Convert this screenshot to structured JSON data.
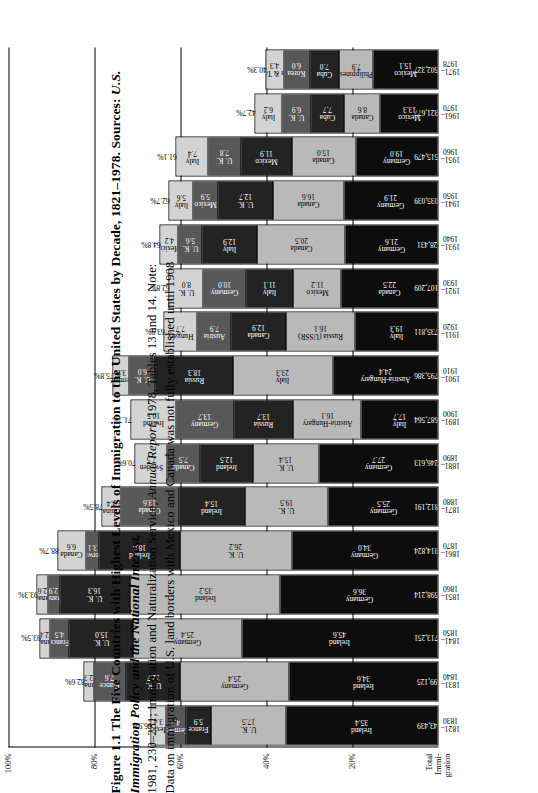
{
  "figure": {
    "number": "Figure 1.1",
    "title": "The Five Countries with Highest Levels of Immigration to the United States by Decade, 1821–1978. Sources:",
    "source_italic_1": "U.S. Immigration Policy and the National Interest,",
    "source_rest_1": " 1981, 230–231; Immigration and Naturalization Service,",
    "source_italic_2": "Annual Report,",
    "source_rest_2": " 1978, Tables 13 and 14. Note:",
    "note": "Data on immigration of U.S. land borders with Mexico and Canada was not fully established until 1908"
  },
  "chart_data": {
    "type": "bar",
    "subtype": "stacked-column",
    "title": "The Five Countries with Highest Levels of Immigration to the United States by Decade, 1821–1978",
    "xlabel": "",
    "ylabel": "",
    "ylim": [
      0,
      100
    ],
    "ytick_labels": [
      "100%",
      "80%",
      "60%",
      "40%",
      "20%",
      "Total Immi- gration"
    ],
    "ytick_values": [
      100,
      80,
      60,
      40,
      20,
      0
    ],
    "grid": true,
    "legend": "none",
    "note": "Each column stacks the five largest source countries; the label above each column is the combined share of the top five.",
    "categories": [
      "1821–1830",
      "1831–1840",
      "1841–1850",
      "1851–1860",
      "1861–1870",
      "1871–1880",
      "1881–1890",
      "1891–1900",
      "1901–1910",
      "1911–1920",
      "1921–1930",
      "1931–1940",
      "1941–1950",
      "1951–1960",
      "1961–1970",
      "1971–1978"
    ],
    "columns": [
      {
        "period": "1821–1830",
        "top5_pct": "66.9%",
        "total": "143,439",
        "segments": [
          {
            "country": "Ireland",
            "value": 35.4,
            "color": "c1"
          },
          {
            "country": "U. K.",
            "value": 17.5,
            "color": "c2"
          },
          {
            "country": "France",
            "value": 5.9,
            "color": "c3"
          },
          {
            "country": "Germany",
            "value": 4.7,
            "color": "c4"
          },
          {
            "country": "Mexico",
            "value": 3.4,
            "color": "c5"
          }
        ]
      },
      {
        "period": "1831–1840",
        "top5_pct": "82.6%",
        "total": "599,125",
        "segments": [
          {
            "country": "Ireland",
            "value": 34.6,
            "color": "c1"
          },
          {
            "country": "Germany",
            "value": 25.4,
            "color": "c2"
          },
          {
            "country": "U. K.",
            "value": 12.7,
            "color": "c3"
          },
          {
            "country": "France",
            "value": 7.6,
            "color": "c4"
          },
          {
            "country": "Canada",
            "value": 2.3,
            "color": "c5"
          }
        ]
      },
      {
        "period": "1841–1850",
        "top5_pct": "93.5%",
        "total": "1,713,251",
        "segments": [
          {
            "country": "Ireland",
            "value": 45.6,
            "color": "c1"
          },
          {
            "country": "Germany",
            "value": 25.4,
            "color": "c2"
          },
          {
            "country": "U. K.",
            "value": 15.0,
            "color": "c3"
          },
          {
            "country": "France",
            "value": 4.5,
            "color": "c4"
          },
          {
            "country": "Canada",
            "value": 2.4,
            "color": "c5"
          }
        ]
      },
      {
        "period": "1851–1860",
        "top5_pct": "93.3%",
        "total": "2,598,214",
        "segments": [
          {
            "country": "Germany",
            "value": 36.6,
            "color": "c1"
          },
          {
            "country": "Ireland",
            "value": 35.2,
            "color": "c2"
          },
          {
            "country": "U. K.",
            "value": 16.3,
            "color": "c3"
          },
          {
            "country": "France",
            "value": 2.9,
            "color": "c4"
          },
          {
            "country": "Canada",
            "value": 2.6,
            "color": "c5"
          }
        ]
      },
      {
        "period": "1861–1870",
        "top5_pct": "88.7%",
        "total": "2,314,824",
        "segments": [
          {
            "country": "Germany",
            "value": 34.0,
            "color": "c1"
          },
          {
            "country": "U. K.",
            "value": 26.2,
            "color": "c2"
          },
          {
            "country": "Ireland",
            "value": 18.8,
            "color": "c3"
          },
          {
            "country": "Norway",
            "value": 3.1,
            "color": "c4"
          },
          {
            "country": "Canada",
            "value": 6.6,
            "color": "c5"
          }
        ]
      },
      {
        "period": "1871–1880",
        "top5_pct": "78.5%",
        "total": "2,812,191",
        "segments": [
          {
            "country": "Germany",
            "value": 25.5,
            "color": "c1"
          },
          {
            "country": "U. K.",
            "value": 19.5,
            "color": "c2"
          },
          {
            "country": "Ireland",
            "value": 15.4,
            "color": "c3"
          },
          {
            "country": "Canada",
            "value": 13.6,
            "color": "c4"
          },
          {
            "country": "China",
            "value": 4.4,
            "color": "c5"
          }
        ]
      },
      {
        "period": "1881–1890",
        "top5_pct": "70.6%",
        "total": "5,246,613",
        "segments": [
          {
            "country": "Germany",
            "value": 27.7,
            "color": "c1"
          },
          {
            "country": "U. K.",
            "value": 15.4,
            "color": "c2"
          },
          {
            "country": "Ireland",
            "value": 12.5,
            "color": "c3"
          },
          {
            "country": "Canada",
            "value": 7.5,
            "color": "c4"
          },
          {
            "country": "Sweden",
            "value": 7.5,
            "color": "c5"
          }
        ]
      },
      {
        "period": "1891–1900",
        "top5_pct": "71.7%",
        "total": "3,687,564",
        "segments": [
          {
            "country": "Italy",
            "value": 17.7,
            "color": "c1"
          },
          {
            "country": "Austria-Hungary",
            "value": 16.1,
            "color": "c2"
          },
          {
            "country": "Russia",
            "value": 13.7,
            "color": "c3"
          },
          {
            "country": "Germany",
            "value": 13.7,
            "color": "c4"
          },
          {
            "country": "Ireland",
            "value": 10.5,
            "color": "c5"
          }
        ]
      },
      {
        "period": "1901–1910",
        "top5_pct": "75.8%",
        "total": "8,795,386",
        "segments": [
          {
            "country": "Austria-Hungary",
            "value": 24.4,
            "color": "c1"
          },
          {
            "country": "Italy",
            "value": 23.3,
            "color": "c2"
          },
          {
            "country": "Russia",
            "value": 18.3,
            "color": "c3"
          },
          {
            "country": "U. K.",
            "value": 6.0,
            "color": "c4"
          },
          {
            "country": "Germany",
            "value": 3.9,
            "color": "c5"
          }
        ]
      },
      {
        "period": "1911–1920",
        "top5_pct": "63.9%",
        "total": "5,735,811",
        "segments": [
          {
            "country": "Italy",
            "value": 19.3,
            "color": "c1"
          },
          {
            "country": "Russia (USSR)",
            "value": 16.1,
            "color": "c2"
          },
          {
            "country": "Canada",
            "value": 12.9,
            "color": "c3"
          },
          {
            "country": "Austria",
            "value": 7.9,
            "color": "c4"
          },
          {
            "country": "Hungary",
            "value": 7.7,
            "color": "c5"
          }
        ]
      },
      {
        "period": "1921–1930",
        "top5_pct": "62.8%",
        "total": "4,107,209",
        "segments": [
          {
            "country": "Canada",
            "value": 22.5,
            "color": "c1"
          },
          {
            "country": "Mexico",
            "value": 11.2,
            "color": "c2"
          },
          {
            "country": "Italy",
            "value": 11.1,
            "color": "c3"
          },
          {
            "country": "Germany",
            "value": 10.0,
            "color": "c4"
          },
          {
            "country": "U. K.",
            "value": 8.0,
            "color": "c5"
          }
        ]
      },
      {
        "period": "1931–1940",
        "top5_pct": "64.8%",
        "total": "528,431",
        "segments": [
          {
            "country": "Germany",
            "value": 21.6,
            "color": "c1"
          },
          {
            "country": "Canada",
            "value": 20.5,
            "color": "c2"
          },
          {
            "country": "Italy",
            "value": 12.9,
            "color": "c3"
          },
          {
            "country": "U. K.",
            "value": 5.6,
            "color": "c4"
          },
          {
            "country": "Mexico",
            "value": 4.2,
            "color": "c5"
          }
        ]
      },
      {
        "period": "1941–1950",
        "top5_pct": "62.7%",
        "total": "1,035,039",
        "segments": [
          {
            "country": "Germany",
            "value": 21.9,
            "color": "c1"
          },
          {
            "country": "Canada",
            "value": 16.6,
            "color": "c2"
          },
          {
            "country": "U. K.",
            "value": 12.7,
            "color": "c3"
          },
          {
            "country": "Mexico",
            "value": 5.9,
            "color": "c4"
          },
          {
            "country": "Italy",
            "value": 5.6,
            "color": "c5"
          }
        ]
      },
      {
        "period": "1951–1960",
        "top5_pct": "61.1%",
        "total": "2,515,479",
        "segments": [
          {
            "country": "Germany",
            "value": 19.0,
            "color": "c1"
          },
          {
            "country": "Canada",
            "value": 15.0,
            "color": "c2"
          },
          {
            "country": "Mexico",
            "value": 11.9,
            "color": "c3"
          },
          {
            "country": "U. K.",
            "value": 7.8,
            "color": "c4"
          },
          {
            "country": "Italy",
            "value": 7.4,
            "color": "c5"
          }
        ]
      },
      {
        "period": "1961–1970",
        "top5_pct": "42.7%",
        "total": "3,321,677",
        "segments": [
          {
            "country": "Mexico",
            "value": 13.3,
            "color": "c1"
          },
          {
            "country": "Canada",
            "value": 8.6,
            "color": "c2"
          },
          {
            "country": "Cuba",
            "value": 7.7,
            "color": "c3"
          },
          {
            "country": "U. K.",
            "value": 6.9,
            "color": "c4"
          },
          {
            "country": "Italy",
            "value": 6.2,
            "color": "c5"
          }
        ]
      },
      {
        "period": "1971–1978",
        "top5_pct": "40.3%",
        "total": "3,502,327",
        "segments": [
          {
            "country": "Mexico",
            "value": 15.1,
            "color": "c1"
          },
          {
            "country": "Philippines",
            "value": 7.9,
            "color": "c2"
          },
          {
            "country": "Cuba",
            "value": 7.0,
            "color": "c3"
          },
          {
            "country": "Korea",
            "value": 6.0,
            "color": "c4"
          },
          {
            "country": "China & Taiwan",
            "value": 4.3,
            "color": "c5"
          }
        ]
      }
    ]
  }
}
